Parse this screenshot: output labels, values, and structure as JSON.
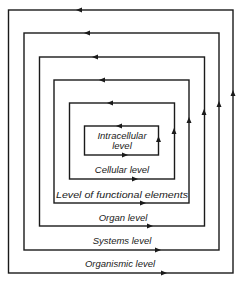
{
  "diagram": {
    "type": "nested-levels",
    "colors": {
      "line": "#1a1a1a",
      "background": "#ffffff"
    },
    "levels": [
      {
        "label": "Organismic level",
        "line2": ""
      },
      {
        "label": "Systems level",
        "line2": ""
      },
      {
        "label": "Organ level",
        "line2": ""
      },
      {
        "label": "Level of functional elements",
        "line2": ""
      },
      {
        "label": "Cellular level",
        "line2": ""
      },
      {
        "label": "Intracellular",
        "line2": "level"
      }
    ],
    "flow": "counter-clockwise: right side up, top leftwards, bottom rightwards"
  }
}
